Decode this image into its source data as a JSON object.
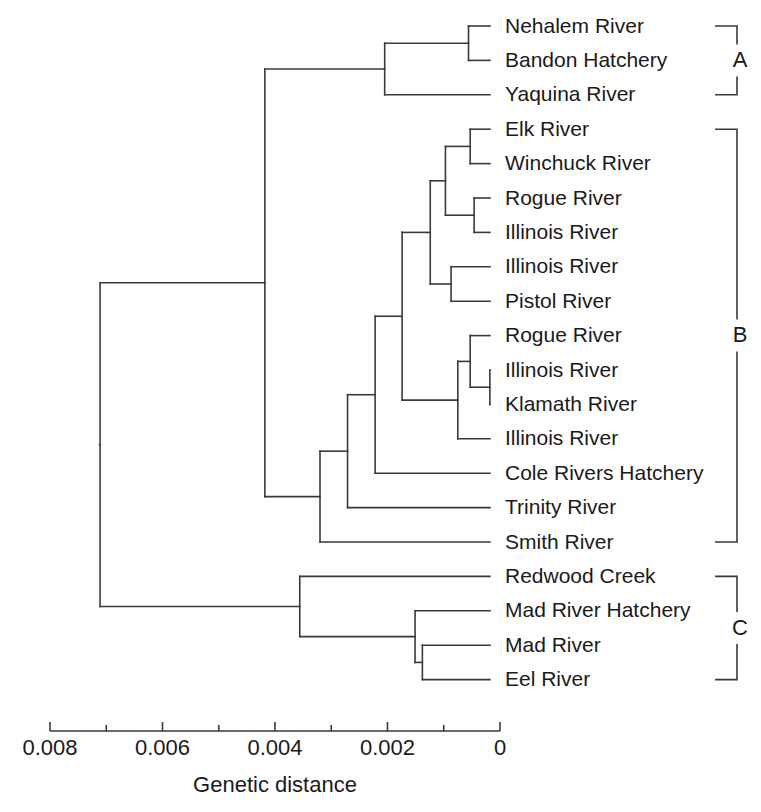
{
  "chart_data": {
    "type": "dendrogram",
    "title": "",
    "xlabel": "Genetic distance",
    "ylabel": "",
    "axis": {
      "reversed": true,
      "xlim": [
        0.008,
        0
      ],
      "major_ticks": [
        0.008,
        0.006,
        0.004,
        0.002,
        0
      ],
      "major_tick_labels": [
        "0.008",
        "0.006",
        "0.004",
        "0.002",
        "0"
      ],
      "minor_ticks": [
        0.007,
        0.005,
        0.003,
        0.001
      ],
      "grid": false,
      "legend": "none"
    },
    "leaves": [
      {
        "id": "t1",
        "label": "Nehalem River",
        "group": "A",
        "height": 0.00056
      },
      {
        "id": "t2",
        "label": "Bandon Hatchery",
        "group": "A",
        "height": 0.00056
      },
      {
        "id": "t3",
        "label": "Yaquina River",
        "group": "A",
        "height": 0.00174
      },
      {
        "id": "t4",
        "label": "Elk River",
        "group": "B",
        "height": 0.00053
      },
      {
        "id": "t5",
        "label": "Winchuck River",
        "group": "B",
        "height": 0.00053
      },
      {
        "id": "t6",
        "label": "Rogue River",
        "group": "B",
        "height": 0.00046
      },
      {
        "id": "t7",
        "label": "Illinois River",
        "group": "B",
        "height": 0.00046
      },
      {
        "id": "t8",
        "label": "Illinois River",
        "group": "B",
        "height": 0.00087
      },
      {
        "id": "t9",
        "label": "Pistol River",
        "group": "B",
        "height": 0.00087
      },
      {
        "id": "t10",
        "label": "Rogue River",
        "group": "B",
        "height": 0.00053
      },
      {
        "id": "t11",
        "label": "Illinois River",
        "group": "B",
        "height": 0.00018
      },
      {
        "id": "t12",
        "label": "Klamath River",
        "group": "B",
        "height": 0.00018
      },
      {
        "id": "t13",
        "label": "Illinois River",
        "group": "B",
        "height": 0.00075
      },
      {
        "id": "t14",
        "label": "Cole Rivers Hatchery",
        "group": "B",
        "height": 0.00222
      },
      {
        "id": "t15",
        "label": "Trinity River",
        "group": "B",
        "height": 0.00271
      },
      {
        "id": "t16",
        "label": "Smith River",
        "group": "B",
        "height": 0.0032
      },
      {
        "id": "t17",
        "label": "Redwood Creek",
        "group": "C",
        "height": 0.00356
      },
      {
        "id": "t18",
        "label": "Mad River Hatchery",
        "group": "C",
        "height": 0.00151
      },
      {
        "id": "t19",
        "label": "Mad River",
        "group": "C",
        "height": 0.00138
      },
      {
        "id": "t20",
        "label": "Eel River",
        "group": "C",
        "height": 0.00138
      }
    ],
    "nodes": [
      {
        "id": "n_ab",
        "height": 0.00418,
        "children": [
          "n_A",
          "n_B"
        ]
      },
      {
        "id": "n_root",
        "height": 0.00711,
        "children": [
          "n_ab",
          "n_C"
        ]
      },
      {
        "id": "n_A",
        "height": 0.00205,
        "children": [
          "n_A1",
          "t3"
        ]
      },
      {
        "id": "n_A1",
        "height": 0.00056,
        "children": [
          "t1",
          "t2"
        ]
      },
      {
        "id": "n_B",
        "height": 0.0032,
        "children": [
          "n_B1",
          "t16"
        ]
      },
      {
        "id": "n_B1",
        "height": 0.00271,
        "children": [
          "n_B2",
          "t15"
        ]
      },
      {
        "id": "n_B2",
        "height": 0.00222,
        "children": [
          "n_B3",
          "t14"
        ]
      },
      {
        "id": "n_B3",
        "height": 0.00174,
        "children": [
          "n_B4",
          "n_B7"
        ]
      },
      {
        "id": "n_B4",
        "height": 0.00124,
        "children": [
          "n_B5",
          "n_B6"
        ]
      },
      {
        "id": "n_B5",
        "height": 0.00097,
        "children": [
          "n_B5a",
          "n_B5b"
        ]
      },
      {
        "id": "n_B5a",
        "height": 0.00053,
        "children": [
          "t4",
          "t5"
        ]
      },
      {
        "id": "n_B5b",
        "height": 0.00046,
        "children": [
          "t6",
          "t7"
        ]
      },
      {
        "id": "n_B6",
        "height": 0.00087,
        "children": [
          "t8",
          "t9"
        ]
      },
      {
        "id": "n_B7",
        "height": 0.00075,
        "children": [
          "n_B8",
          "t13"
        ]
      },
      {
        "id": "n_B8",
        "height": 0.00053,
        "children": [
          "t10",
          "n_B9"
        ]
      },
      {
        "id": "n_B9",
        "height": 0.00018,
        "children": [
          "t11",
          "t12"
        ]
      },
      {
        "id": "n_C",
        "height": 0.00356,
        "children": [
          "t17",
          "n_C1"
        ]
      },
      {
        "id": "n_C1",
        "height": 0.00151,
        "children": [
          "t18",
          "n_C2"
        ]
      },
      {
        "id": "n_C2",
        "height": 0.00138,
        "children": [
          "t19",
          "t20"
        ]
      }
    ],
    "groups": [
      {
        "letter": "A",
        "first_leaf": "t1",
        "last_leaf": "t3"
      },
      {
        "letter": "B",
        "first_leaf": "t4",
        "last_leaf": "t16"
      },
      {
        "letter": "C",
        "first_leaf": "t17",
        "last_leaf": "t20"
      }
    ],
    "colors": {
      "line": "#3a3a3a",
      "text": "#1a1a1a",
      "background": "#ffffff"
    }
  }
}
